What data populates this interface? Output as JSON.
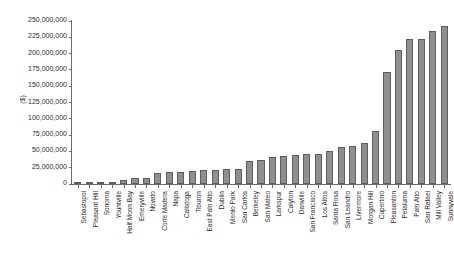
{
  "chart_data": {
    "type": "bar",
    "title": "",
    "xlabel": "",
    "ylabel": "($)",
    "ylim": [
      0,
      250000000
    ],
    "ytick_step": 25000000,
    "grid": false,
    "legend": null,
    "bar_color": "#8f8f8f",
    "bar_edge_color": "#5d5d5d",
    "axis_color": "#6b6b6b",
    "ytick_labels": [
      "250,000,000",
      "225,000,000",
      "200,000,000",
      "175,000,000",
      "150,000,000",
      "125,000,000",
      "100,000,000",
      "75,000,000",
      "50,000,000",
      "25,000,000",
      "0"
    ],
    "ytick_values": [
      250000000,
      225000000,
      200000000,
      175000000,
      150000000,
      125000000,
      100000000,
      75000000,
      50000000,
      25000000,
      0
    ],
    "categories": [
      "Sebastopol",
      "Pleasant Hill",
      "Sonoma",
      "Yountville",
      "Half Moon Bay",
      "Emeryville",
      "Novato",
      "Corte Madera",
      "Napa",
      "Calistoga",
      "Tiburon",
      "East Palo Alto",
      "Dublin",
      "Menlo Park",
      "San Carlos",
      "Berkeley",
      "San Mateo",
      "Larkspur",
      "Calyton",
      "Danville",
      "San Francisco",
      "Los Altos",
      "Santa Rosa",
      "San Leandro",
      "Livermore",
      "Morgan Hill",
      "Cupertino",
      "Pleasanton",
      "Petaluma",
      "Palo Alto",
      "San Rafael",
      "Mill Valley",
      "Sunnyvale"
    ],
    "values": [
      1500000,
      2000000,
      2500000,
      3000000,
      5500000,
      9000000,
      9500000,
      16500000,
      18500000,
      19000000,
      20000000,
      21000000,
      22000000,
      22500000,
      23000000,
      35500000,
      37000000,
      41000000,
      43000000,
      44000000,
      45500000,
      46500000,
      51000000,
      57000000,
      58000000,
      63500000,
      82000000,
      172000000,
      205000000,
      222000000,
      222500000,
      234000000,
      243000000
    ]
  }
}
